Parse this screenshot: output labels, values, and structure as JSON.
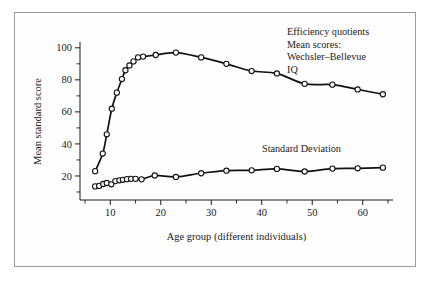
{
  "figure": {
    "border_color": "#9a9a9a",
    "background": "#ffffff",
    "line_color": "#111111",
    "marker_fill": "#ffffff"
  },
  "annotations": {
    "topright": {
      "line1": "Efficiency quotients",
      "line2": "Mean scores:",
      "line3": "Wechsler–Bellevue",
      "line4": "IQ"
    },
    "sd_label": "Standard Deviation"
  },
  "chart_data": {
    "type": "line",
    "title": "",
    "xlabel": "Age group (different individuals)",
    "ylabel": "Mean standard score",
    "xlim": [
      4,
      66
    ],
    "ylim": [
      5,
      103
    ],
    "grid": false,
    "legend_position": "inline-annotation",
    "x_ticks_major": [
      10,
      20,
      30,
      40,
      50,
      60
    ],
    "x_tick_labels": [
      "10",
      "20",
      "30",
      "40",
      "50",
      "60"
    ],
    "x_ticks_minor": [
      5,
      15,
      25,
      35,
      45,
      55,
      65
    ],
    "y_ticks_major": [
      20,
      40,
      60,
      80,
      100
    ],
    "y_tick_labels": [
      "20",
      "40",
      "60",
      "80",
      "100"
    ],
    "y_ticks_minor": [
      10,
      30,
      50,
      70,
      90
    ],
    "series": [
      {
        "name": "Efficiency quotients Mean scores: Wechsler-Bellevue IQ",
        "marker": "open-circle",
        "points": [
          {
            "x": 7.0,
            "y": 23.0
          },
          {
            "x": 8.5,
            "y": 34.0
          },
          {
            "x": 9.3,
            "y": 46.0
          },
          {
            "x": 10.3,
            "y": 62.0
          },
          {
            "x": 11.3,
            "y": 72.0
          },
          {
            "x": 12.3,
            "y": 80.5
          },
          {
            "x": 13.0,
            "y": 86.0
          },
          {
            "x": 13.8,
            "y": 89.0
          },
          {
            "x": 14.6,
            "y": 91.5
          },
          {
            "x": 15.5,
            "y": 94.0
          },
          {
            "x": 16.5,
            "y": 94.5
          },
          {
            "x": 19.0,
            "y": 95.5
          },
          {
            "x": 23.0,
            "y": 97.0
          },
          {
            "x": 28.0,
            "y": 94.0
          },
          {
            "x": 33.0,
            "y": 90.0
          },
          {
            "x": 38.0,
            "y": 85.5
          },
          {
            "x": 43.0,
            "y": 84.0
          },
          {
            "x": 48.5,
            "y": 77.5
          },
          {
            "x": 54.0,
            "y": 77.0
          },
          {
            "x": 59.0,
            "y": 74.0
          },
          {
            "x": 64.0,
            "y": 71.0
          }
        ]
      },
      {
        "name": "Standard Deviation",
        "marker": "open-circle",
        "points": [
          {
            "x": 7.0,
            "y": 13.5
          },
          {
            "x": 7.8,
            "y": 13.8
          },
          {
            "x": 8.6,
            "y": 15.0
          },
          {
            "x": 9.3,
            "y": 15.6
          },
          {
            "x": 10.2,
            "y": 14.8
          },
          {
            "x": 11.0,
            "y": 16.8
          },
          {
            "x": 11.8,
            "y": 17.3
          },
          {
            "x": 12.5,
            "y": 17.6
          },
          {
            "x": 13.3,
            "y": 18.0
          },
          {
            "x": 14.1,
            "y": 18.2
          },
          {
            "x": 15.0,
            "y": 18.2
          },
          {
            "x": 16.2,
            "y": 17.9
          },
          {
            "x": 18.8,
            "y": 20.3
          },
          {
            "x": 23.0,
            "y": 19.4
          },
          {
            "x": 28.0,
            "y": 21.7
          },
          {
            "x": 33.0,
            "y": 23.3
          },
          {
            "x": 38.0,
            "y": 23.5
          },
          {
            "x": 43.0,
            "y": 24.4
          },
          {
            "x": 48.5,
            "y": 22.8
          },
          {
            "x": 54.0,
            "y": 24.6
          },
          {
            "x": 59.0,
            "y": 24.8
          },
          {
            "x": 64.0,
            "y": 25.2
          }
        ]
      }
    ]
  }
}
